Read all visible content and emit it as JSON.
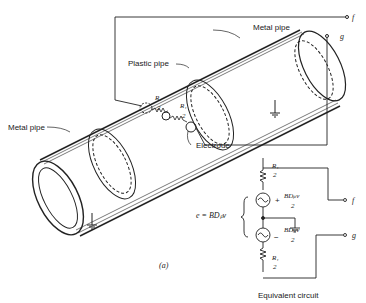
{
  "labels": {
    "metal_pipe_top": "Metal pipe",
    "plastic_pipe": "Plastic pipe",
    "metal_pipe_left": "Metal pipe",
    "electrode": "Electrode",
    "terminal_f": "f",
    "terminal_g": "g",
    "figure_label": "(a)",
    "equivalent_circuit": "Equivalent circuit"
  },
  "pipe_resistors": {
    "r1_num": "R₁",
    "r1_den": "2",
    "r2_num": "R₁",
    "r2_den": "2",
    "source": "e"
  },
  "circuit": {
    "emf": "e = BDₚv",
    "top_res_num": "R₁",
    "top_res_den": "2",
    "plus_sign": "+",
    "top_src_num": "BDₚv",
    "top_src_den": "2",
    "minus_sign": "−",
    "bot_src_num": "BDₚv",
    "bot_src_den": "2",
    "bot_res_num": "R₁",
    "bot_res_den": "2"
  }
}
